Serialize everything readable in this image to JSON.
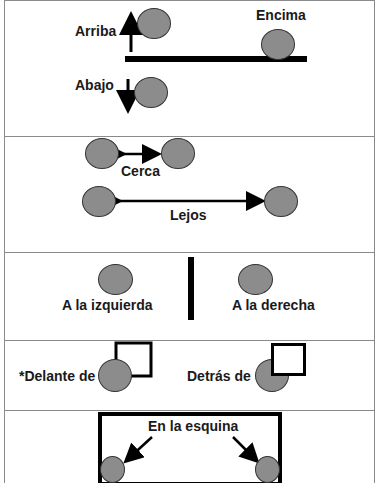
{
  "colors": {
    "ball_fill": "#8c8c8c",
    "ball_stroke": "#333333",
    "line": "#000000",
    "text": "#1a1a1a",
    "divider": "#8a8a8a"
  },
  "panels": [
    {
      "id": "vertical",
      "labels": {
        "up": "Arriba",
        "on_top": "Encima",
        "down": "Abajo"
      }
    },
    {
      "id": "distance",
      "labels": {
        "near": "Cerca",
        "far": "Lejos"
      }
    },
    {
      "id": "sides",
      "labels": {
        "left": "A la izquierda",
        "right": "A la derecha"
      }
    },
    {
      "id": "front_back",
      "labels": {
        "front": "*Delante de",
        "behind": "Detrás de"
      }
    },
    {
      "id": "corner",
      "labels": {
        "corner": "En la esquina"
      }
    }
  ]
}
